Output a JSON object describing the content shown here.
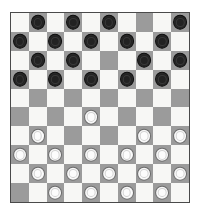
{
  "board": {
    "title": "Checkers Board",
    "variant": "international-draughts-10x10",
    "columns": 10,
    "rows": 10,
    "light_square_color": "#f7f7f5",
    "dark_square_color": "#9b9b9b",
    "border_color": "#4a4a4a",
    "background_color": "#ffffff",
    "dark_square_parity": "odd-column-on-even-row",
    "piece_colors": {
      "black": "#222222",
      "white": "#fcfcfc",
      "white_outline": "#6b6b6b",
      "black_outline": "#0d0d0d"
    },
    "piece_counts": {
      "black": 18,
      "white": 19,
      "empty_dark_squares": 13,
      "total_dark_squares": 50
    },
    "legend": {
      "black_label": "Black piece",
      "white_label": "White piece",
      "empty_label": "Empty square"
    },
    "grid": [
      [
        "",
        "black",
        "",
        "black",
        "",
        "black",
        "",
        "",
        "",
        "black"
      ],
      [
        "black",
        "",
        "black",
        "",
        "black",
        "",
        "black",
        "",
        "black",
        ""
      ],
      [
        "",
        "black",
        "",
        "black",
        "",
        "",
        "",
        "black",
        "",
        "black"
      ],
      [
        "black",
        "",
        "black",
        "",
        "black",
        "",
        "black",
        "",
        "black",
        ""
      ],
      [
        "",
        "",
        "",
        "",
        "",
        "",
        "",
        "",
        "",
        ""
      ],
      [
        "",
        "",
        "",
        "",
        "white",
        "",
        "",
        "",
        "",
        ""
      ],
      [
        "",
        "white",
        "",
        "",
        "",
        "",
        "",
        "white",
        "",
        "white"
      ],
      [
        "white",
        "",
        "white",
        "",
        "white",
        "",
        "white",
        "",
        "white",
        ""
      ],
      [
        "",
        "white",
        "",
        "white",
        "",
        "white",
        "",
        "white",
        "",
        "white"
      ],
      [
        "",
        "",
        "white",
        "",
        "white",
        "",
        "white",
        "",
        "white",
        ""
      ]
    ]
  }
}
